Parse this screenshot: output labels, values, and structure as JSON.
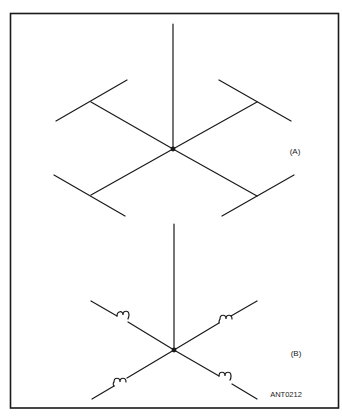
{
  "figure": {
    "id_label": "ANT0212",
    "panels": [
      {
        "label": "(A)",
        "description": "Ground-plane antenna: vertical radiator with four sloping radials, each terminated by a perpendicular crossbar (capacity hat)"
      },
      {
        "label": "(B)",
        "description": "Ground-plane antenna: vertical radiator with four sloping radials, each containing a loading coil"
      }
    ]
  },
  "colors": {
    "line": "#1a1a1a",
    "background": "#ffffff"
  }
}
